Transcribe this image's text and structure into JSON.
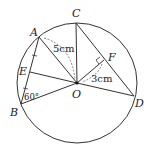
{
  "figure": {
    "circle": {
      "center_label": "O",
      "radius_px": 60
    },
    "points": {
      "A": "A",
      "B": "B",
      "C": "C",
      "D": "D",
      "E": "E",
      "F": "F",
      "O": "O"
    },
    "measurements": {
      "OA": "5cm",
      "OF": "3cm",
      "angle_B": "60°"
    },
    "colors": {
      "stroke": "#333333",
      "text": "#222222",
      "background": "#ffffff"
    }
  }
}
